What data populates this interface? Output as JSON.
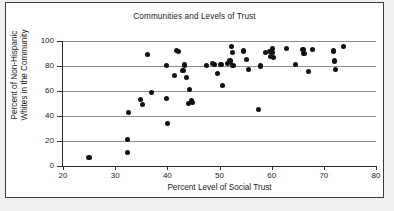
{
  "chart_data": {
    "type": "scatter",
    "title": "Communities and Levels of Trust",
    "xlabel": "Percent Level of Social Trust",
    "ylabel_line1": "Percent of Non-Hispanic",
    "ylabel_line2": "Whites in the Community",
    "ylabel": "Percent of Non-Hispanic Whites in the Community",
    "xlim": [
      20,
      80
    ],
    "ylim": [
      0,
      100
    ],
    "xticks": [
      20,
      30,
      40,
      50,
      60,
      70,
      80
    ],
    "yticks": [
      0,
      20,
      40,
      60,
      80,
      100
    ],
    "grid": "horizontal",
    "legend": "none",
    "marker": "filled-circle",
    "marker_color": "#111111",
    "gridline_color": "#8d8d8d",
    "points": [
      [
        25.0,
        7
      ],
      [
        32.3,
        21
      ],
      [
        32.4,
        11
      ],
      [
        32.5,
        42.5
      ],
      [
        34.8,
        53
      ],
      [
        35.2,
        49.5
      ],
      [
        36.2,
        89.5
      ],
      [
        37.0,
        58.5
      ],
      [
        39.8,
        80.5
      ],
      [
        39.9,
        54
      ],
      [
        40.0,
        34
      ],
      [
        41.3,
        72.5
      ],
      [
        41.8,
        92.5
      ],
      [
        42.2,
        91.5
      ],
      [
        43.0,
        76.5
      ],
      [
        43.3,
        80.8
      ],
      [
        43.6,
        71
      ],
      [
        44.2,
        61
      ],
      [
        44.0,
        50
      ],
      [
        44.6,
        52
      ],
      [
        44.9,
        51
      ],
      [
        47.5,
        80.5
      ],
      [
        48.6,
        82
      ],
      [
        49.0,
        81.5
      ],
      [
        49.6,
        74
      ],
      [
        50.3,
        81
      ],
      [
        50.5,
        64.5
      ],
      [
        51.6,
        82
      ],
      [
        52.0,
        84
      ],
      [
        52.3,
        95.5
      ],
      [
        52.5,
        90.5
      ],
      [
        52.6,
        80.5
      ],
      [
        54.6,
        92
      ],
      [
        55.2,
        85.5
      ],
      [
        55.5,
        77
      ],
      [
        57.4,
        45
      ],
      [
        57.8,
        80
      ],
      [
        58.8,
        91
      ],
      [
        59.6,
        91.5
      ],
      [
        59.8,
        87.5
      ],
      [
        60.1,
        94
      ],
      [
        60.2,
        91
      ],
      [
        60.3,
        87
      ],
      [
        62.8,
        94
      ],
      [
        64.5,
        81
      ],
      [
        66.0,
        93
      ],
      [
        66.2,
        90
      ],
      [
        67.0,
        75.5
      ],
      [
        67.8,
        93
      ],
      [
        71.8,
        92
      ],
      [
        72.0,
        84
      ],
      [
        72.2,
        77
      ],
      [
        73.8,
        95.5
      ]
    ]
  }
}
